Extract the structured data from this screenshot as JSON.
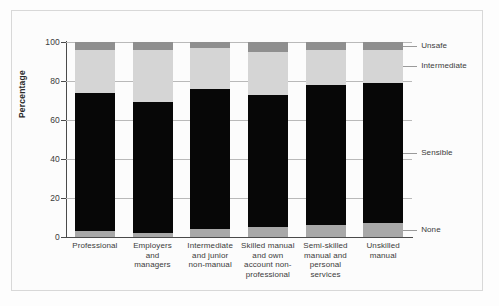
{
  "chart_data": {
    "type": "bar",
    "stacked": true,
    "title": "",
    "xlabel": "",
    "ylabel": "Percentage",
    "ylim": [
      0,
      100
    ],
    "yticks": [
      0,
      20,
      40,
      60,
      80,
      100
    ],
    "ytick_labels": [
      "0",
      "20",
      "40",
      "60",
      "80",
      "100"
    ],
    "grid": true,
    "legend_position": "right",
    "categories": [
      "Professional",
      "Employers and managers",
      "Intermediate and junior non-manual",
      "Skilled manual and own account non-professional",
      "Semi-skilled manual and personal services",
      "Unskilled manual"
    ],
    "category_lines": [
      [
        "Professional"
      ],
      [
        "Employers",
        "and",
        "managers"
      ],
      [
        "Intermediate",
        "and junior",
        "non-manual"
      ],
      [
        "Skilled manual",
        "and own",
        "account non-",
        "professional"
      ],
      [
        "Semi-skilled",
        "manual and",
        "personal",
        "services"
      ],
      [
        "Unskilled",
        "manual"
      ]
    ],
    "series": [
      {
        "name": "None",
        "color": "#a8a8a8",
        "values": [
          3,
          2,
          4,
          5,
          6,
          7
        ]
      },
      {
        "name": "Sensible",
        "color": "#070707",
        "values": [
          71,
          67,
          72,
          68,
          72,
          72
        ]
      },
      {
        "name": "Intermediate",
        "color": "#d5d5d5",
        "values": [
          22,
          27,
          21,
          22,
          18,
          17
        ]
      },
      {
        "name": "Unsafe",
        "color": "#8f8f8f",
        "values": [
          4,
          4,
          3,
          5,
          4,
          4
        ]
      }
    ],
    "cumulative_tops": {
      "none": [
        3,
        2,
        4,
        5,
        6,
        7
      ],
      "sensible": [
        74,
        69,
        76,
        73,
        78,
        79
      ],
      "intermediate": [
        96,
        96,
        97,
        95,
        96,
        96
      ],
      "unsafe": [
        100,
        100,
        100,
        100,
        100,
        100
      ]
    }
  },
  "legend": {
    "items": [
      {
        "label": "Unsafe",
        "color": "#8f8f8f"
      },
      {
        "label": "Intermediate",
        "color": "#d5d5d5"
      },
      {
        "label": "Sensible",
        "color": "#070707"
      },
      {
        "label": "None",
        "color": "#a8a8a8"
      }
    ]
  },
  "axis": {
    "y_label": "Percentage",
    "y_ticks": [
      "100",
      "80",
      "60",
      "40",
      "20",
      "0"
    ]
  }
}
